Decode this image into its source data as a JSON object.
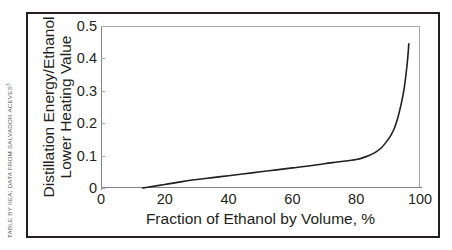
{
  "credit": {
    "text": "TABLE BY IIEA; DATA FROM SALVADOR ACEVES",
    "footnote_marker": "3"
  },
  "chart_data": {
    "type": "line",
    "title": "",
    "xlabel": "Fraction of Ethanol by Volume, %",
    "ylabel_line1": "Distillation Energy/Ethanol",
    "ylabel_line2": "Lower Heating Value",
    "xlim": [
      0,
      100
    ],
    "ylim": [
      0,
      0.5
    ],
    "xticks": [
      "0",
      "20",
      "40",
      "60",
      "80",
      "100"
    ],
    "xtick_values": [
      0,
      20,
      40,
      60,
      80,
      100
    ],
    "yticks": [
      "0",
      "0.1",
      "0.2",
      "0.3",
      "0.4",
      "0.5"
    ],
    "ytick_values": [
      0,
      0.1,
      0.2,
      0.3,
      0.4,
      0.5
    ],
    "grid": false,
    "legend": null,
    "series": [
      {
        "name": "Distillation energy ratio",
        "color": "#231f20",
        "x": [
          13,
          15,
          20,
          25,
          30,
          35,
          40,
          45,
          50,
          55,
          60,
          65,
          70,
          74,
          78,
          80,
          82,
          84,
          86,
          88,
          90,
          91,
          92,
          93,
          94,
          95,
          96,
          96.5
        ],
        "y": [
          0.0,
          0.003,
          0.011,
          0.019,
          0.026,
          0.032,
          0.038,
          0.044,
          0.05,
          0.056,
          0.062,
          0.068,
          0.075,
          0.08,
          0.085,
          0.088,
          0.093,
          0.1,
          0.11,
          0.125,
          0.15,
          0.165,
          0.185,
          0.215,
          0.255,
          0.305,
          0.385,
          0.445
        ]
      }
    ]
  }
}
